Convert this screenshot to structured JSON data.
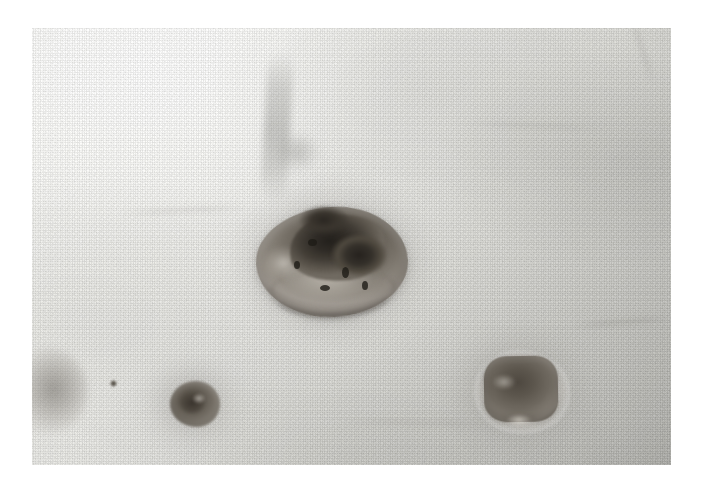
{
  "page": {
    "background_color": "#ffffff",
    "width": 703,
    "height": 488
  },
  "photograph": {
    "name": "clinical-skin-photograph",
    "media_type": "grayscale-clinical-photograph",
    "subject": "skin-surface-with-multiple-lesions",
    "frame": {
      "left": 32,
      "top": 28,
      "width": 639,
      "height": 437
    },
    "tonal_range": {
      "lightest_corner": "upper-left",
      "lightest_color": "#fbfbf9",
      "darkest_corner": "lower-right",
      "darkest_color": "#a7a7a2",
      "lesion_darkest_color": "#221f1b"
    },
    "surface_texture": "fine-halftone-woven-grain",
    "text_overlays": [],
    "scale_markers": []
  },
  "features": [
    {
      "id": "lesion-central",
      "label": "central-crusted-nodular-lesion",
      "description": "large irregular crusted nodule with dark necrotic upper core and lighter keratotic lower half",
      "bounds": {
        "left": 245,
        "top": 195,
        "width": 170,
        "height": 130
      },
      "tone": "dark"
    },
    {
      "id": "lesion-right",
      "label": "right-pigmented-papule",
      "description": "rounded darkly pigmented papule with raised pale rim",
      "bounds": {
        "left": 450,
        "top": 330,
        "width": 95,
        "height": 85
      },
      "tone": "dark"
    },
    {
      "id": "lesion-left-small",
      "label": "small-left-pigmented-papule",
      "description": "small round pigmented papule with faint surrounding halo",
      "bounds": {
        "left": 145,
        "top": 360,
        "width": 58,
        "height": 52
      },
      "tone": "medium-dark"
    },
    {
      "id": "lesion-edge-partial",
      "label": "partial-lesion-at-left-edge",
      "description": "lesion clipped by the left border of the photograph",
      "bounds": {
        "left": 28,
        "top": 352,
        "width": 34,
        "height": 44
      },
      "tone": "medium"
    },
    {
      "id": "linear-shadow",
      "label": "vertical-linear-shadow",
      "description": "faint vertical linear shadow or scar in the upper field",
      "bounds": {
        "left": 264,
        "top": 52,
        "width": 26,
        "height": 152
      },
      "tone": "faint"
    },
    {
      "id": "tiny-dot",
      "label": "small-dark-dot",
      "description": "tiny isolated dark punctate mark",
      "bounds": {
        "left": 110,
        "top": 380,
        "width": 7,
        "height": 7
      },
      "tone": "dark"
    }
  ]
}
